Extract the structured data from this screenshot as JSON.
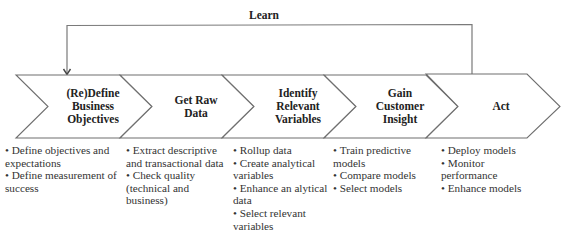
{
  "learn_loop": {
    "label": "Learn",
    "line_color": "#7a7a7a"
  },
  "steps": [
    {
      "title": "(Re)Define Business Objectives",
      "title_lines": [
        "(Re)Define",
        "Business",
        "Objectives"
      ],
      "bullets": [
        "Define objectives and expectations",
        "Define measurement of success"
      ]
    },
    {
      "title": "Get Raw Data",
      "title_lines": [
        "Get Raw",
        "Data"
      ],
      "bullets": [
        "Extract descriptive and transactional data",
        "Check quality (technical and business)"
      ]
    },
    {
      "title": "Identify Relevant Variables",
      "title_lines": [
        "Identify",
        "Relevant",
        "Variables"
      ],
      "bullets": [
        "Rollup data",
        "Create analytical variables",
        "Enhance an alytical data",
        "Select relevant variables"
      ]
    },
    {
      "title": "Gain Customer Insight",
      "title_lines": [
        "Gain",
        "Customer",
        "Insight"
      ],
      "bullets": [
        "Train predictive models",
        "Compare models",
        "Select models"
      ]
    },
    {
      "title": "Act",
      "title_lines": [
        "Act"
      ],
      "bullets": [
        "Deploy models",
        "Monitor performance",
        "Enhance models"
      ]
    }
  ],
  "colors": {
    "outline": "#6e6e6e",
    "text": "#222222",
    "background": "#ffffff"
  }
}
